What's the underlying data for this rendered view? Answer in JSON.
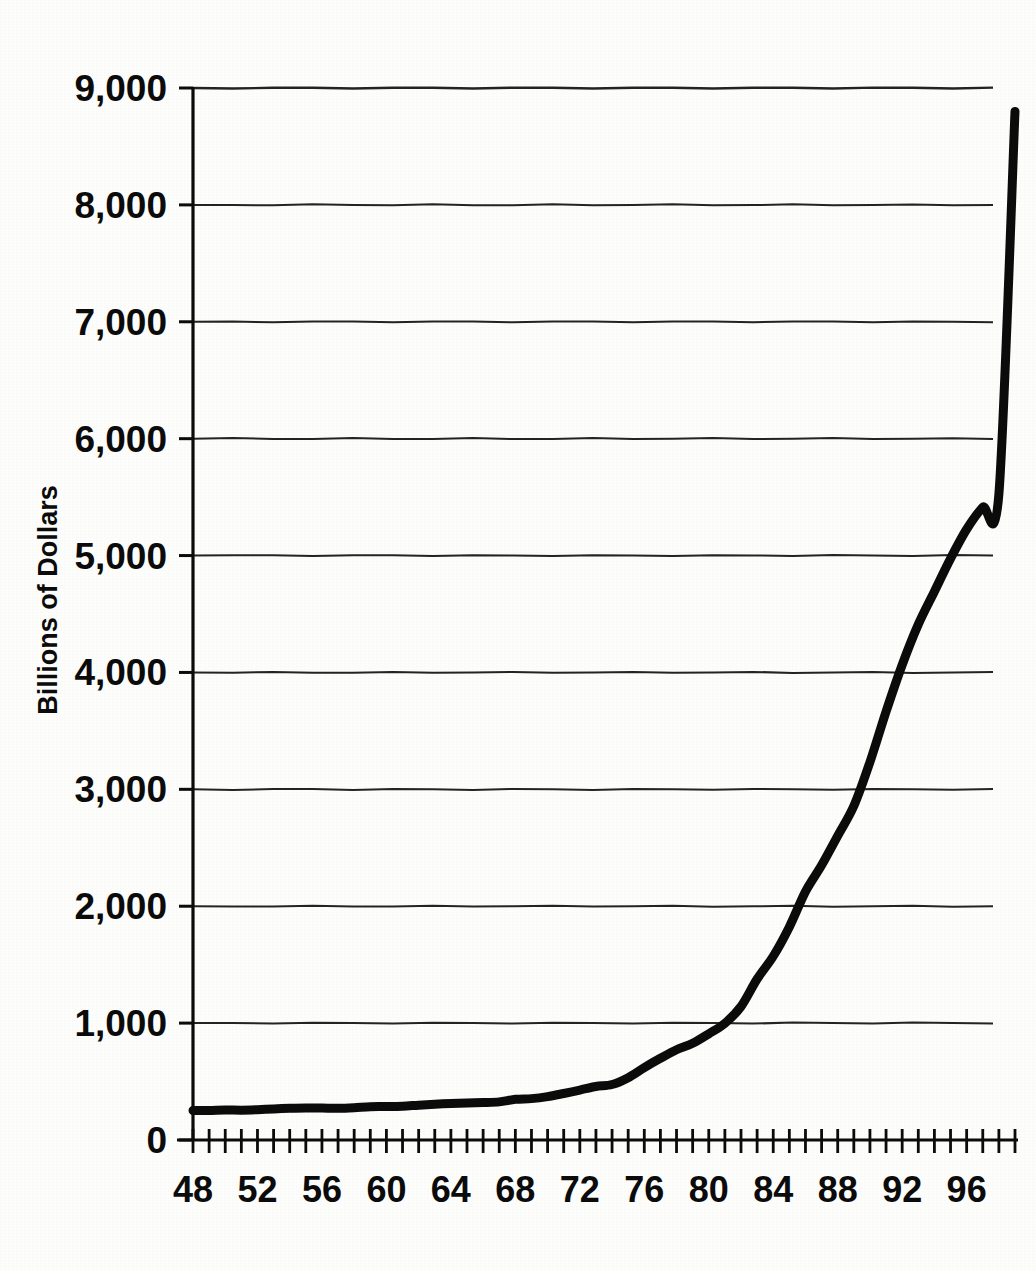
{
  "figure": {
    "kind": "scanned-line-chart",
    "background_color": "#fdfdfc",
    "ink_color": "#0b0b0b"
  },
  "axis_labels": {
    "y_axis_title": "Billions of Dollars",
    "y_ticks": [
      "0",
      "1,000",
      "2,000",
      "3,000",
      "4,000",
      "5,000",
      "6,000",
      "7,000",
      "8,000",
      "9,000"
    ],
    "x_ticks_labeled": [
      "48",
      "52",
      "56",
      "60",
      "64",
      "68",
      "72",
      "76",
      "80",
      "84",
      "88",
      "92",
      "96"
    ]
  },
  "chart_data": {
    "type": "line",
    "title": "",
    "subtitle": "",
    "xlabel": "",
    "ylabel": "Billions of Dollars",
    "xlim": [
      48,
      99
    ],
    "ylim": [
      0,
      9000
    ],
    "grid": "horizontal",
    "legend": "none",
    "x_tick_interval": 1,
    "x_label_interval": 4,
    "y_tick_interval": 1000,
    "line_color": "#0b0b0b",
    "line_width_px": 9,
    "series": [
      {
        "name": "Billions of Dollars",
        "x": [
          48,
          49,
          50,
          51,
          52,
          53,
          54,
          55,
          56,
          57,
          58,
          59,
          60,
          61,
          62,
          63,
          64,
          65,
          66,
          67,
          68,
          69,
          70,
          71,
          72,
          73,
          74,
          75,
          76,
          77,
          78,
          79,
          80,
          81,
          82,
          83,
          84,
          85,
          86,
          87,
          88,
          89,
          90,
          91,
          92,
          93,
          94,
          95,
          96,
          97,
          98,
          99
        ],
        "values": [
          252,
          253,
          257,
          255,
          259,
          266,
          271,
          274,
          273,
          271,
          276,
          285,
          286,
          289,
          298,
          306,
          312,
          317,
          320,
          326,
          348,
          354,
          371,
          398,
          427,
          458,
          475,
          533,
          620,
          699,
          772,
          827,
          908,
          998,
          1142,
          1377,
          1572,
          1823,
          2125,
          2350,
          2602,
          2857,
          3233,
          3665,
          4065,
          4411,
          4693,
          4974,
          5225,
          5413,
          5526,
          8800
        ]
      }
    ],
    "annotations": []
  },
  "bleed_through": {
    "rows": [
      "                                                                  ",
      "                                                                              ",
      "                                                                        "
    ]
  }
}
